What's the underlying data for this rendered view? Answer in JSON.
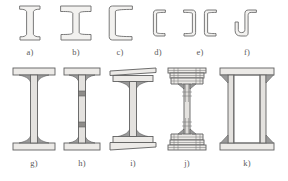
{
  "figure": {
    "background_color": "#ffffff",
    "outline_color": "#6b6b6b",
    "fill_color": "#f2f1ef",
    "shade_color": "#9a9a9a",
    "caption_color": "#5a5a5a",
    "rows": 2,
    "item_count": 11
  },
  "rows": {
    "top": {
      "id": "row-top",
      "items": [
        {
          "key": "a",
          "caption": "a)",
          "name": "narrow-flange-i-beam",
          "description": "Rolled I-section with narrow tapered flanges"
        },
        {
          "key": "b",
          "caption": "b)",
          "name": "wide-flange-i-beam",
          "description": "Rolled I-section with wide parallel flanges"
        },
        {
          "key": "c",
          "caption": "c)",
          "name": "channel-section",
          "description": "Rolled channel (C) section with tapered flanges"
        },
        {
          "key": "d",
          "caption": "d)",
          "name": "small-channel-section",
          "description": "Small rolled channel section, rounded corners"
        },
        {
          "key": "e",
          "caption": "e)",
          "name": "double-channel-section",
          "description": "Two channels placed back to back"
        },
        {
          "key": "f",
          "caption": "f)",
          "name": "z-section",
          "description": "Z / S shaped rolled section"
        }
      ]
    },
    "bottom": {
      "id": "row-bot",
      "items": [
        {
          "key": "g",
          "caption": "g)",
          "name": "welded-plate-girder",
          "description": "Deep welded plate girder with fillet welds"
        },
        {
          "key": "h",
          "caption": "h)",
          "name": "plate-girder-with-web-stiffeners",
          "description": "Plate girder with transverse web stiffeners"
        },
        {
          "key": "i",
          "caption": "i)",
          "name": "plate-girder-with-cover-plates",
          "description": "Plate girder with additional flange cover plates"
        },
        {
          "key": "j",
          "caption": "j)",
          "name": "riveted-built-up-girder",
          "description": "Riveted built-up girder with flange angles and cover plates"
        },
        {
          "key": "k",
          "caption": "k)",
          "name": "box-girder",
          "description": "Welded box girder with two webs"
        }
      ]
    }
  }
}
